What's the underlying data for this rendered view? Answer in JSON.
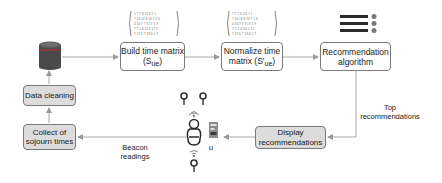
{
  "diagram": {
    "nodes": {
      "database": {
        "icon": "database-icon",
        "color": "#8a3a3a"
      },
      "build_matrix": {
        "line1": "Build time matrix",
        "line2_prefix": "(S",
        "line2_sub": "ue",
        "line2_suffix": ")"
      },
      "normalize_matrix": {
        "line1": "Normalize time",
        "line2_prefix": "matrix (S'",
        "line2_sub": "ue",
        "line2_suffix": ")"
      },
      "recommendation_algorithm": {
        "line1": "Recommendation",
        "line2": "algorithm"
      },
      "display_recommendations": {
        "line1": "Display",
        "line2": "recommendations"
      },
      "collect_sojourn": {
        "line1": "Collect of",
        "line2": "sojourn times"
      },
      "data_cleaning": {
        "label": "Data cleaning"
      },
      "user": {
        "label": "u",
        "icon": "person-icon"
      }
    },
    "edge_labels": {
      "top_recommendations": {
        "line1": "Top",
        "line2": "recommendations"
      },
      "beacon_readings": {
        "line1": "Beacon",
        "line2": "readings"
      }
    },
    "icons": [
      "matrix-icon",
      "ranked-list-icon",
      "beacon-icon",
      "smartphone-icon",
      "wifi-signal-icon"
    ]
  }
}
